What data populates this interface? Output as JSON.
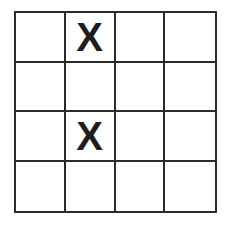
{
  "board": {
    "rows": 4,
    "cols": 4,
    "cells": [
      [
        "",
        "X",
        "",
        ""
      ],
      [
        "",
        "",
        "",
        ""
      ],
      [
        "",
        "X",
        "",
        ""
      ],
      [
        "",
        "",
        "",
        ""
      ]
    ]
  }
}
